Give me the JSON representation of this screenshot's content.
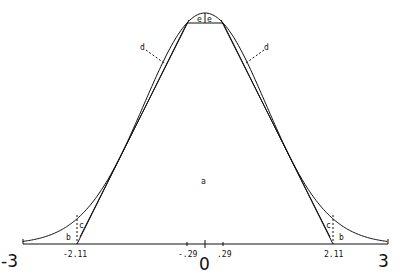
{
  "figure": {
    "axis": {
      "min_label": "-3",
      "max_label": "3",
      "zero_label": "0",
      "tick_labels": [
        "-2.11",
        "-.29",
        ".29",
        "2.11"
      ]
    },
    "region_labels": {
      "a": "a",
      "b_left": "b",
      "b_right": "b",
      "c_left": "c",
      "c_right": "c",
      "d_left": "d",
      "d_right": "d",
      "e_left": "e",
      "e_right": "e"
    },
    "colors": {
      "line": "#111111",
      "background": "#ffffff"
    }
  }
}
